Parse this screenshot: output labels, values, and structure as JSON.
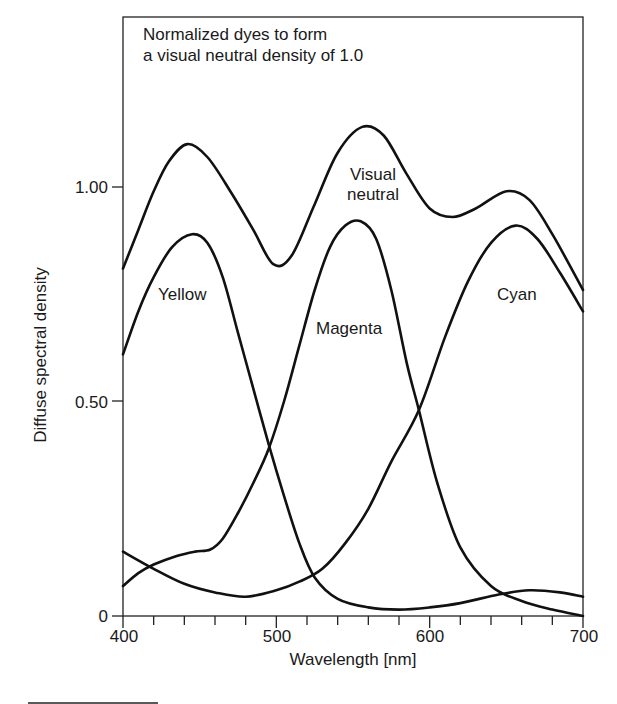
{
  "chart_data": {
    "type": "line",
    "title": "Normalized dyes to form a visual neutral density of 1.0",
    "title_lines": [
      "Normalized dyes to form",
      "a visual neutral density of 1.0"
    ],
    "xlabel": "Wavelength [nm]",
    "ylabel": "Diffuse spectral density",
    "xlim": [
      400,
      700
    ],
    "ylim": [
      0,
      1.3
    ],
    "x_ticks": [
      400,
      500,
      600,
      700
    ],
    "x_tick_labels": [
      "400",
      "500",
      "600",
      "700"
    ],
    "x_minor_tick_step": 20,
    "y_ticks": [
      0,
      0.5,
      1.0
    ],
    "y_tick_labels": [
      "0",
      "0.50",
      "1.00"
    ],
    "grid": false,
    "legend": "none (inline curve labels)",
    "series": [
      {
        "name": "Visual neutral",
        "label_lines": [
          "Visual",
          "neutral"
        ],
        "x": [
          400,
          410,
          420,
          430,
          442,
          455,
          470,
          485,
          498,
          510,
          525,
          540,
          556,
          570,
          585,
          600,
          615,
          630,
          650,
          665,
          680,
          700
        ],
        "values": [
          0.81,
          0.9,
          0.99,
          1.06,
          1.1,
          1.07,
          0.99,
          0.9,
          0.82,
          0.84,
          0.96,
          1.08,
          1.14,
          1.12,
          1.03,
          0.95,
          0.93,
          0.95,
          0.99,
          0.97,
          0.89,
          0.76
        ]
      },
      {
        "name": "Yellow",
        "x": [
          400,
          410,
          420,
          432,
          445,
          455,
          465,
          475,
          485,
          495,
          505,
          515,
          525,
          540,
          560,
          580,
          600,
          620,
          645,
          665,
          685,
          700
        ],
        "values": [
          0.61,
          0.71,
          0.79,
          0.86,
          0.89,
          0.87,
          0.79,
          0.66,
          0.53,
          0.4,
          0.28,
          0.17,
          0.09,
          0.04,
          0.02,
          0.015,
          0.02,
          0.03,
          0.05,
          0.06,
          0.055,
          0.045
        ]
      },
      {
        "name": "Magenta",
        "x": [
          400,
          410,
          420,
          435,
          447,
          457,
          465,
          475,
          485,
          495,
          505,
          515,
          525,
          535,
          545,
          555,
          565,
          575,
          585,
          593,
          605,
          620,
          640,
          660,
          680,
          700
        ],
        "values": [
          0.07,
          0.1,
          0.12,
          0.14,
          0.15,
          0.155,
          0.18,
          0.24,
          0.31,
          0.39,
          0.5,
          0.63,
          0.76,
          0.86,
          0.91,
          0.92,
          0.88,
          0.76,
          0.59,
          0.48,
          0.31,
          0.16,
          0.07,
          0.035,
          0.015,
          0.0
        ]
      },
      {
        "name": "Cyan",
        "x": [
          400,
          420,
          440,
          460,
          480,
          500,
          515,
          530,
          545,
          560,
          575,
          593,
          610,
          625,
          640,
          656,
          670,
          685,
          700
        ],
        "values": [
          0.15,
          0.11,
          0.075,
          0.055,
          0.045,
          0.06,
          0.08,
          0.11,
          0.17,
          0.25,
          0.36,
          0.48,
          0.65,
          0.78,
          0.87,
          0.91,
          0.88,
          0.8,
          0.71
        ]
      }
    ],
    "annotations": [
      {
        "text": "Yellow",
        "x": 452,
        "y": 0.75
      },
      {
        "text": "Magenta",
        "x": 555,
        "y": 0.66
      },
      {
        "text": "Cyan",
        "x": 665,
        "y": 0.75
      },
      {
        "text": "Visual neutral",
        "x": 555,
        "y": 1.0
      }
    ]
  },
  "labels": {
    "title_line1": "Normalized dyes to form",
    "title_line2": "a visual neutral density of 1.0",
    "xlabel": "Wavelength [nm]",
    "ylabel": "Diffuse spectral density",
    "x400": "400",
    "x500": "500",
    "x600": "600",
    "x700": "700",
    "y0": "0",
    "y050": "0.50",
    "y100": "1.00",
    "yellow": "Yellow",
    "magenta": "Magenta",
    "cyan": "Cyan",
    "neutral_line1": "Visual",
    "neutral_line2": "neutral"
  },
  "colors": {
    "curve": "#111111",
    "frame": "#222222",
    "background": "#ffffff"
  }
}
